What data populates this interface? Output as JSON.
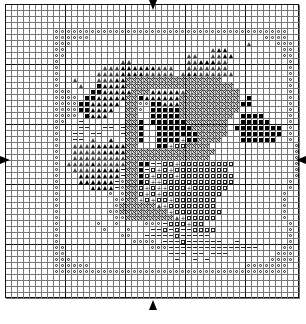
{
  "chart": {
    "cols": 49,
    "rows": 49,
    "cell_px": 6,
    "legend_codes": {
      "o": "open-circle",
      "x": "cross-hatch",
      "B": "filled-square",
      "A": "filled-triangle",
      "a": "open-triangle",
      "s": "open-square",
      "-": "dash",
      "+": "plus",
      ".": "empty"
    },
    "grid": [
      ".................................................",
      ".................................................",
      ".................................................",
      ".................................................",
      "........ooooooooooooooooooooooooooooooooooooooo...",
      "........oooooo.............................oooo...",
      "........ooo.............................a....ooo..",
      "........oo........................aAA.........oo..",
      "........oo....................aa..aaAA........oo..",
      "........o..........aa.........aaAAAaa..........o..",
      "........o.......aaaAAAAAAaaa..aaaaaaa..........o..",
      "........o......aaaaAAAAaaaaa.aAAaaaaaa.........o..",
      "........o..a...aaaAAxxxxxxxxxxxxxxxx...........o..",
      "........o...a..BAAAAxxxxxxxxxxxxxxxxxx.........o..",
      "........ooo...BBAAAAAxxxAAAAAaxxxxxxxxx........o..",
      "........oooo.BBAAAAAxxBAAAAAAxxxxxxxxxx.B......o..",
      "........ooooBBAAAAA.xxooBBAAAxxxxxxxxxxBB......o..",
      "........ooooBBAAAA..xxo.BBBBBxxxxxxxxxx........o..",
      "........oooo.BAAA...xx..BBBBBxxxxxxxxx.BBBB....o..",
      "........oo..-.......xxB.BBBBBBxxxxxxx..BBBBB...o..",
      "........o...--..--.-xxB..BBBBBBxxxxxx.BBBBBBBB.o..",
      "........o..--.--...-xxB..BBBBBBBxxxxx..BBBBBBB.o..",
      "........o..--.a..A..xxB..BBBB+BBxxxx...BBBBBB..o..",
      "........o..aaaAAAAAAxx...BB+ssxxxx..............o.",
      "........o..aaaaaAAAAxxxxxxxxxxxxxxx.............o.",
      "........o..aaaaaaaaaxxxxxxxxxxxxxx..............o.",
      "........o.aaaaAaaaaaxxBB--ss+sssssssss..........o.",
      "........o..aaaaAAAA-xxB-s+s+sssssssss...........o.",
      "........o...AAAAAAA-xxBs+sss+sssssssss..........o.",
      "........o...AAAAAA-oxxBs++ssssssssssss.........o..",
      "........o.....AAAA-oxxs+s++sss+ssssss..........o..",
      "........o........o.oxxs+s+ssssssssss..........o...",
      "........o.........ooxx+s+ss+sssssss...........o...",
      "........o.........oxxxxxxa+ssssssss...........o...",
      "........o........ooxxxxxxxx+ssssssss..........o...",
      "........o.........ooxxxxxxxxa+sssss...........o...",
      "........o......o..o....ooo-sss+ss..............o..",
      "........o.......o...o...--s-s--ssss............o..",
      "........o..........oo..-----s-----.............o..",
      "........o............oooo.---s------..-........o..",
      "........oo..............ooo---------------....oo..",
      "........oo.................---.--.---........ooo..",
      "........ooo.................-..-.-..........oooo..",
      "........oooooo..........................ooooooo...",
      "........ooooooooooooooooooooooooooooooooooooooo...",
      ".................................................",
      ".................................................",
      ".................................................",
      "................................................."
    ]
  },
  "markers": {
    "top_arrow": "center-arrow-down",
    "bottom_arrow": "center-arrow-up",
    "left_arrow": "center-arrow-right",
    "right_arrow": "center-arrow-left"
  }
}
